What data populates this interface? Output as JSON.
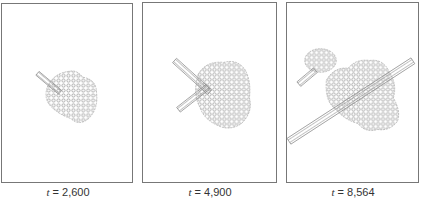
{
  "figure": {
    "stroke_color": "#888888",
    "border_color": "#777777",
    "panels": [
      {
        "id": "panel-1",
        "time_symbol": "t",
        "equals": " = ",
        "time_value": "2,600"
      },
      {
        "id": "panel-2",
        "time_symbol": "t",
        "equals": " = ",
        "time_value": "4,900"
      },
      {
        "id": "panel-3",
        "time_symbol": "t",
        "equals": " = ",
        "time_value": "8,564"
      }
    ]
  }
}
